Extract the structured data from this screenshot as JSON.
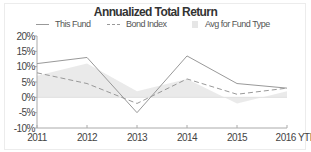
{
  "chart_data": {
    "type": "line",
    "title": "Annualized Total Return",
    "xlabel": "",
    "ylabel": "",
    "categories": [
      "2011",
      "2012",
      "2013",
      "2014",
      "2015",
      "2016 YTD"
    ],
    "series": [
      {
        "name": "This Fund",
        "style": "solid",
        "color": "#999999",
        "values": [
          11,
          13,
          -5,
          13.5,
          4.5,
          3
        ]
      },
      {
        "name": "Bond Index",
        "style": "dashed",
        "color": "#999999",
        "values": [
          8,
          4.5,
          -2,
          6,
          1,
          3
        ]
      },
      {
        "name": "Avg for Fund Type",
        "style": "area",
        "color": "#e6e6e6",
        "values": [
          7,
          11,
          2,
          6,
          -2,
          2
        ]
      }
    ],
    "yticks": [
      "20%",
      "15%",
      "10%",
      "5%",
      "0%",
      "-5%",
      "-10%"
    ],
    "ylim": [
      -10,
      20
    ],
    "grid": false,
    "legend_position": "top"
  },
  "legend": {
    "this_fund": "This Fund",
    "bond_index": "Bond Index",
    "avg_fund_type": "Avg for Fund Type"
  }
}
